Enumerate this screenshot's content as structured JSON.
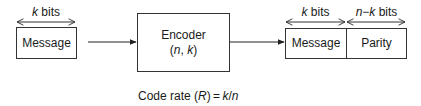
{
  "diagram": {
    "input": {
      "width_label_var": "k",
      "width_label_unit": " bits",
      "box_label": "Message"
    },
    "encoder": {
      "title": "Encoder",
      "params_open": "(",
      "param_n": "n",
      "params_sep": ", ",
      "param_k": "k",
      "params_close": ")"
    },
    "output": {
      "message_width_var": "k",
      "message_width_unit": " bits",
      "parity_width_var": "n",
      "parity_width_minus": "−",
      "parity_width_var2": "k",
      "parity_width_unit": " bits",
      "message_label": "Message",
      "parity_label": "Parity"
    },
    "caption": {
      "prefix": "Code rate (",
      "symbol": "R",
      "mid": ") = ",
      "formula_k": "k",
      "slash": "/",
      "formula_n": "n"
    },
    "colors": {
      "stroke": "#333333",
      "text": "#1a1a1a"
    }
  }
}
